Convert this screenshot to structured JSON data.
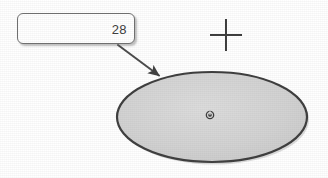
{
  "image": {
    "width": 328,
    "height": 178,
    "background_color": "#ffffff",
    "description": "Scanned technical diagram: a rounded callout box labeled 28 with a leader arrow pointing to a gray filled ellipse, plus a crosshair mark"
  },
  "callout": {
    "name": "callout-box",
    "value": "28",
    "border_color": "#6f6f6f",
    "fill_color": "#ffffff",
    "text_color": "#3a3a3a",
    "x": 17,
    "y": 13,
    "width": 118,
    "height": 31
  },
  "leader": {
    "name": "leader-arrow",
    "color": "#4a4a4a",
    "from_x": 118,
    "from_y": 45,
    "to_x": 161,
    "to_y": 77
  },
  "ellipse": {
    "name": "ellipse-shape",
    "center_x": 212,
    "center_y": 117,
    "radius_x": 95,
    "radius_y": 45,
    "fill_color": "#d2d2d2",
    "stroke_color": "#3c3c3c",
    "stroke_width": 2.2
  },
  "center_marker": {
    "name": "ellipse-center-marker",
    "glyph": "power-icon",
    "x": 210,
    "y": 115,
    "size": 9,
    "color": "#2e2e2e"
  },
  "crosshair": {
    "name": "crosshair-marker",
    "glyph": "plus-icon",
    "center_x": 226,
    "center_y": 35,
    "arm_length": 16,
    "color": "#3a3a3a",
    "stroke_width": 2
  }
}
